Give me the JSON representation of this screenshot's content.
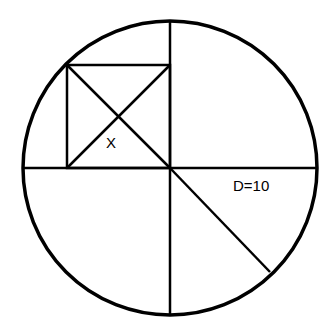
{
  "diagram": {
    "labels": {
      "square_label": "X",
      "diameter_label": "D=10"
    },
    "colors": {
      "stroke": "#000000",
      "background": "#ffffff"
    },
    "circle": {
      "cx": 170,
      "cy": 168,
      "r": 147
    },
    "shapes": [
      "circle",
      "horizontal-diameter",
      "vertical-diameter",
      "inscribed-square-upper-left-quadrant",
      "square-diagonals",
      "radius-lower-right"
    ]
  }
}
